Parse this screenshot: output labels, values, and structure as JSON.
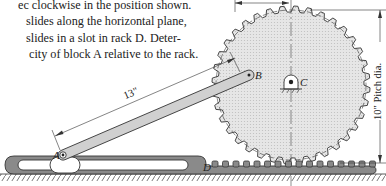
{
  "problem": {
    "lines": [
      "ec clockwise in the position shown.",
      "slides along the horizontal plane,",
      "slides in a slot in rack D. Deter-",
      "city of block A relative to the rack."
    ]
  },
  "figure": {
    "labels": {
      "A": "A",
      "B": "B",
      "C": "C",
      "D": "D"
    },
    "dimensions": {
      "link_length": "13\"",
      "pitch_diameter": "10\" Pitch dia."
    },
    "colors": {
      "ink": "#222222",
      "gear_fill": "#dedede",
      "rack_fill": "#8a8a8a",
      "link_fill": "#d0d0d0",
      "background": "#ffffff"
    }
  }
}
